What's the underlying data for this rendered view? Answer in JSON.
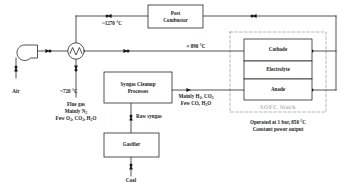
{
  "diagram": {
    "type": "process-flow-diagram",
    "colors": {
      "line": "#1a1a1a",
      "box_stroke": "#1a1a1a",
      "box_fill": "#ffffff",
      "dashed_boundary": "#9a9a9a",
      "watermark_text": "#b9b9b9",
      "text": "#1a1a1a",
      "background": "#ffffff"
    },
    "units": [
      {
        "id": "post-combustor",
        "label": "Post\nCombustor",
        "line1": "Post",
        "line2": "Combustor"
      },
      {
        "id": "syngas-cleanup",
        "label": "Syngas Cleanup\nProcesses",
        "line1": "Syngas Cleanup",
        "line2": "Processes"
      },
      {
        "id": "gasifier",
        "label": "Gasifier",
        "line1": "Gasifier",
        "line2": ""
      },
      {
        "id": "blower",
        "label": "Air blower",
        "line1": "",
        "line2": ""
      },
      {
        "id": "heat-exchanger",
        "label": "Heat exchanger",
        "line1": "",
        "line2": ""
      }
    ],
    "stack": {
      "watermark": "SOFC Stack",
      "layers": [
        {
          "id": "cathode",
          "label": "Cathode"
        },
        {
          "id": "electrolyte",
          "label": "Electrolyte"
        },
        {
          "id": "anode",
          "label": "Anode"
        }
      ],
      "note_line1": "Operated at 1 bar, 850 °C",
      "note_line2": "Constant power output"
    },
    "stream_labels": [
      {
        "id": "air-inlet",
        "text": "Air"
      },
      {
        "id": "coal-inlet",
        "text": "Coal"
      },
      {
        "id": "raw-syngas",
        "text": "Raw syngas"
      },
      {
        "id": "combustor-outlet-temp",
        "text": "~1270 °C"
      },
      {
        "id": "cathode-inlet-temp",
        "text": "≈ 890 °C"
      },
      {
        "id": "preheated-air-temp",
        "text": "~720 °C"
      }
    ],
    "flue_gas": {
      "line1": "Flue gas",
      "line2_prefix": "Mainly N",
      "line2_sub": "2",
      "line3_a": "Few O",
      "line3_a_sub": "2",
      "line3_b": ", CO",
      "line3_b_sub": "2",
      "line3_c": ", H",
      "line3_c_sub": "2",
      "line3_d": "O"
    },
    "clean_syngas": {
      "line1_a": "Mainly H",
      "line1_a_sub": "2",
      "line1_b": ", CO",
      "line1_b_sub": "2",
      "line2_a": "Few CO, H",
      "line2_a_sub": "2",
      "line2_b": "O"
    }
  }
}
